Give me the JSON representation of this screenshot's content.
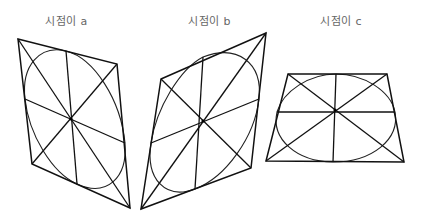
{
  "figures": [
    {
      "id": "a",
      "label": "시점이 a",
      "label_x": 45,
      "corners": {
        "tl": [
          18,
          39
        ],
        "tr": [
          117,
          64
        ],
        "br": [
          130,
          208
        ],
        "bl": [
          32,
          164
        ]
      },
      "center": [
        71,
        119
      ],
      "tangents": {
        "top": [
          66,
          51
        ],
        "right": [
          125,
          143
        ],
        "bottom": [
          77,
          184
        ],
        "left": [
          25,
          99
        ]
      }
    },
    {
      "id": "b",
      "label": "시점이 b",
      "label_x": 188,
      "corners": {
        "tl": [
          161,
          79
        ],
        "tr": [
          266,
          33
        ],
        "br": [
          251,
          168
        ],
        "bl": [
          141,
          209
        ]
      },
      "center": [
        203,
        121
      ],
      "tangents": {
        "top": [
          203,
          57
        ],
        "right": [
          259,
          99
        ],
        "bottom": [
          195,
          189
        ],
        "left": [
          151,
          143
        ]
      }
    },
    {
      "id": "c",
      "label": "시점이 c",
      "label_x": 320,
      "corners": {
        "tl": [
          288,
          74
        ],
        "tr": [
          387,
          74
        ],
        "br": [
          404,
          162
        ],
        "bl": [
          266,
          161
        ]
      },
      "center": [
        335,
        110
      ],
      "tangents": {
        "top": [
          336,
          74
        ],
        "right": [
          395,
          112
        ],
        "bottom": [
          333,
          162
        ],
        "left": [
          277,
          112
        ]
      }
    }
  ],
  "style": {
    "stroke": "#111111",
    "label_color": "#666666",
    "background": "#ffffff"
  }
}
